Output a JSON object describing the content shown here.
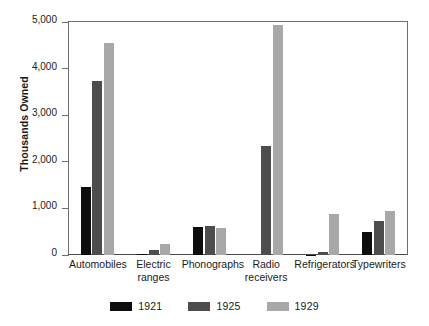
{
  "chart_data": {
    "type": "bar",
    "title": "",
    "subtitle": "",
    "xlabel": "",
    "ylabel": "Thousands Owned",
    "ylim": [
      0,
      5000
    ],
    "ytick_values": [
      0,
      1000,
      2000,
      3000,
      4000,
      5000
    ],
    "ytick_labels": [
      "0",
      "1,000",
      "2,000",
      "3,000",
      "4,000",
      "5,000"
    ],
    "grid": false,
    "legend_position": "bottom-center",
    "categories": [
      "Automobiles",
      "Electric\nranges",
      "Phonographs",
      "Radio\nreceivers",
      "Refrigerators",
      "Typewriters"
    ],
    "series": [
      {
        "name": "1921",
        "color": "#0d0d0d",
        "values": [
          1450,
          30,
          600,
          0,
          5,
          490
        ]
      },
      {
        "name": "1925",
        "color": "#4d4d4d",
        "values": [
          3730,
          110,
          620,
          2330,
          75,
          720
        ]
      },
      {
        "name": "1929",
        "color": "#a8a8a8",
        "values": [
          4560,
          240,
          580,
          4930,
          870,
          950
        ]
      }
    ]
  },
  "axis": {
    "y_title": "Thousands Owned",
    "axis_color": "#6e6e6e",
    "baseline_color": "#4a4a4a"
  },
  "legend": {
    "entries": [
      {
        "label": "1921",
        "color": "#0d0d0d"
      },
      {
        "label": "1925",
        "color": "#4d4d4d"
      },
      {
        "label": "1929",
        "color": "#a8a8a8"
      }
    ]
  }
}
